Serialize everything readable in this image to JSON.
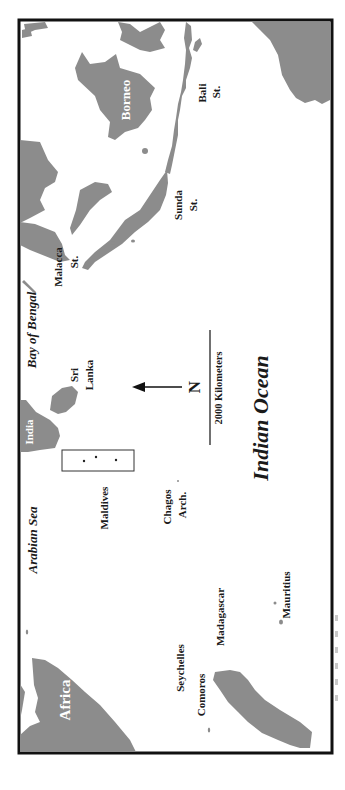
{
  "map": {
    "orientation": "rotated 90 degrees counter-clockwise (north points left)",
    "land_color": "#8c8c8c",
    "water_color": "#ffffff",
    "frame_color": "#111111",
    "labels": {
      "africa": "Africa",
      "india": "India",
      "borneo": "Borneo",
      "arabian_sea": "Arabian Sea",
      "bay_of_bengal": "Bay of Bengal",
      "indian_ocean": "Indian Ocean",
      "sri": "Sri",
      "lanka": "Lanka",
      "maldives": "Maldives",
      "chagos": "Chagos",
      "arch": "Arch.",
      "seychelles": "Seychelles",
      "comoros": "Comoros",
      "madagascar": "Madagascar",
      "mauritius": "Mauritius",
      "malacca": "Malacca",
      "malacca_st": "St.",
      "sunda": "Sunda",
      "sunda_st": "St.",
      "bali": "Bali",
      "bali_st": "St."
    },
    "north_arrow": {
      "label": "N"
    },
    "scale_bar": {
      "label": "2000 Kilometers"
    }
  }
}
